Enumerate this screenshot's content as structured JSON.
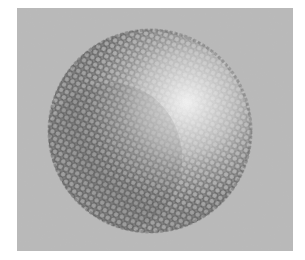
{
  "image": {
    "description": "Grayscale electron micrograph of a spherical particle with a hexagonal lattice surface texture",
    "background_color": "#b9b9b9",
    "border_color": "#ffffff",
    "sphere": {
      "center_x": 133,
      "center_y": 123,
      "radius": 102,
      "highlight_x": 168,
      "highlight_y": 92,
      "highlight_color": "#f2f2f2",
      "shadow_color": "#8a8a8a",
      "lattice_color": "#5a5a5a"
    }
  }
}
